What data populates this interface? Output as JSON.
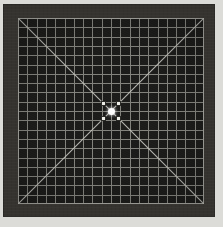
{
  "image": {
    "title": "Grid Test Pattern",
    "type": "resolution-test-chart",
    "description": "Square grid calibration target with two full diagonals and a central focus marker"
  },
  "colors": {
    "paper_background": "#dcdcd8",
    "frame": "#35332f",
    "plate_background": "#1b1b19",
    "grid_line": "#9a9a94",
    "diagonal_line": "#c8c8c2",
    "center_dot": "#ffffff",
    "corner_marker": "#efefe9"
  },
  "frame": {
    "left": 3,
    "top": 4,
    "width": 212,
    "height": 213,
    "border_thickness": 15
  },
  "grid": {
    "left": 15,
    "top": 14,
    "width": 186,
    "height": 186,
    "columns": 20,
    "rows": 20,
    "cell_size": 9.3,
    "line_width": 1,
    "outline": true
  },
  "diagonals": [
    {
      "name": "diagonal-tl-br",
      "x1": 0,
      "y1": 0,
      "x2": 186,
      "y2": 186
    },
    {
      "name": "diagonal-tr-bl",
      "x1": 186,
      "y1": 0,
      "x2": 0,
      "y2": 186
    }
  ],
  "center_target": {
    "center_x": 93,
    "center_y": 93,
    "dot_diameter": 7,
    "markers": [
      {
        "name": "marker-top-left",
        "position": "tl",
        "size": 5
      },
      {
        "name": "marker-top-right",
        "position": "tr",
        "size": 5
      },
      {
        "name": "marker-bottom-left",
        "position": "bl",
        "size": 5
      },
      {
        "name": "marker-bottom-right",
        "position": "br",
        "size": 5
      }
    ]
  }
}
